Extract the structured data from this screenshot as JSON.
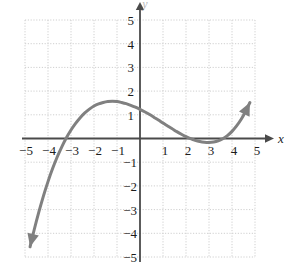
{
  "chart_data": {
    "type": "line",
    "title": "",
    "subtitle": "",
    "xlabel": "x",
    "ylabel": "y",
    "xlim": [
      -5,
      5
    ],
    "ylim": [
      -5,
      5
    ],
    "grid": true,
    "grid_step": 1,
    "legend": "none",
    "x_ticks": [
      -5,
      -4,
      -3,
      -2,
      -1,
      1,
      2,
      3,
      4,
      5
    ],
    "y_ticks": [
      5,
      4,
      3,
      2,
      1,
      -1,
      -2,
      -3,
      -4,
      -5
    ],
    "x_tick_labels": [
      "−5",
      "−4",
      "−3",
      "−2",
      "−1",
      "1",
      "2",
      "3",
      "4",
      "5"
    ],
    "y_tick_labels": [
      "5",
      "4",
      "3",
      "2",
      "1",
      "−1",
      "−2",
      "−3",
      "−4",
      "−5"
    ],
    "series": [
      {
        "name": "cubic curve",
        "color": "#808080",
        "arrow_start": true,
        "arrow_end": true,
        "roots": [
          -4,
          1,
          3
        ],
        "local_max": [
          -2,
          3
        ],
        "local_min": [
          2,
          -0.6
        ],
        "y_intercept": 1.3,
        "x": [
          -4.78,
          -4.6,
          -4.4,
          -4.2,
          -4.0,
          -3.8,
          -3.6,
          -3.4,
          -3.2,
          -3.0,
          -2.8,
          -2.6,
          -2.4,
          -2.2,
          -2.0,
          -1.8,
          -1.6,
          -1.4,
          -1.2,
          -1.0,
          -0.8,
          -0.6,
          -0.4,
          -0.2,
          0.0,
          0.2,
          0.4,
          0.6,
          0.8,
          1.0,
          1.2,
          1.4,
          1.6,
          1.8,
          2.0,
          2.2,
          2.4,
          2.6,
          2.8,
          3.0,
          3.2,
          3.4,
          3.6,
          3.8,
          4.0,
          4.2,
          4.4,
          4.6,
          4.78
        ],
        "y": [
          -4.57,
          -3.85,
          -3.11,
          -2.43,
          -1.82,
          -1.27,
          -0.78,
          -0.35,
          0.03,
          0.36,
          0.64,
          0.88,
          1.08,
          1.24,
          1.37,
          1.46,
          1.52,
          1.56,
          1.57,
          1.56,
          1.52,
          1.47,
          1.4,
          1.32,
          1.23,
          1.13,
          1.02,
          0.9,
          0.78,
          0.65,
          0.53,
          0.41,
          0.29,
          0.18,
          0.08,
          -0.01,
          -0.08,
          -0.13,
          -0.16,
          -0.17,
          -0.15,
          -0.1,
          -0.01,
          0.12,
          0.3,
          0.53,
          0.81,
          1.16,
          1.52
        ]
      }
    ],
    "annotations": []
  },
  "axes": {
    "x_axis_label": "x",
    "y_axis_label": "y",
    "origin_label": ""
  },
  "colors": {
    "curve": "#808080",
    "axis": "#4a4a4a",
    "grid": "#cfcfcf",
    "text": "#1c1c1c",
    "background": "#ffffff"
  }
}
